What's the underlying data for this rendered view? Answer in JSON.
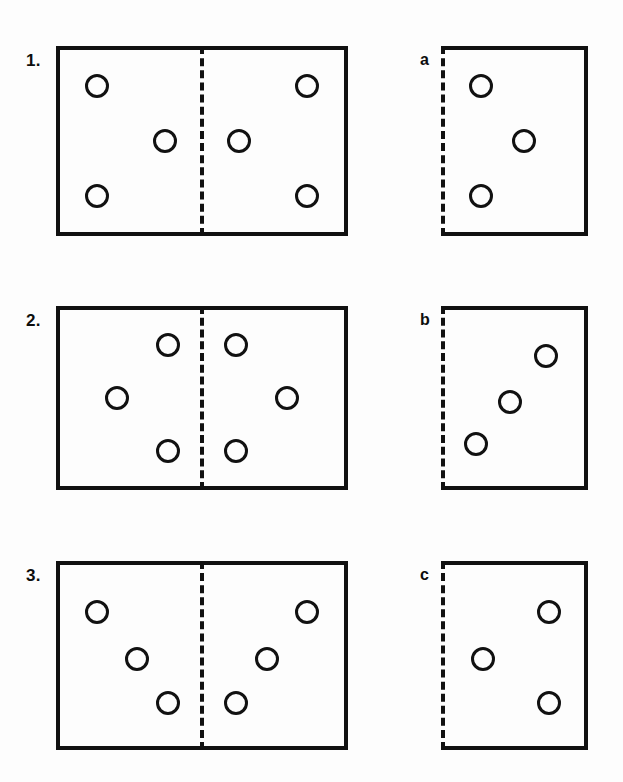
{
  "page": {
    "background_color": "#fdfdfd",
    "ink_color": "#111111",
    "width": 623,
    "height": 782
  },
  "legend": {
    "mirror_line_style": "dashed",
    "circle_style": "outline",
    "panel_border_style": "solid"
  },
  "rows": [
    {
      "id": "row-1",
      "top": 46,
      "height": 190,
      "question": {
        "label": "1.",
        "name": "question-panel-1",
        "mirror": "vertical-center-dashed",
        "dots": [
          {
            "name": "dot-1-left-top",
            "cx_pct": 13,
            "cy_pct": 20,
            "d": 24
          },
          {
            "name": "dot-1-left-middle",
            "cx_pct": 37,
            "cy_pct": 50,
            "d": 24
          },
          {
            "name": "dot-1-left-bottom",
            "cx_pct": 13,
            "cy_pct": 80,
            "d": 24
          },
          {
            "name": "dot-1-right-top",
            "cx_pct": 87,
            "cy_pct": 20,
            "d": 24
          },
          {
            "name": "dot-1-right-middle",
            "cx_pct": 63,
            "cy_pct": 50,
            "d": 24
          },
          {
            "name": "dot-1-right-bottom",
            "cx_pct": 87,
            "cy_pct": 80,
            "d": 24
          }
        ]
      },
      "answer": {
        "label": "a",
        "name": "answer-panel-a",
        "mirror": "left-edge-dashed",
        "dots": [
          {
            "name": "dot-a-top",
            "cx_pct": 26,
            "cy_pct": 20,
            "d": 24
          },
          {
            "name": "dot-a-middle",
            "cx_pct": 57,
            "cy_pct": 50,
            "d": 24
          },
          {
            "name": "dot-a-bottom",
            "cx_pct": 26,
            "cy_pct": 80,
            "d": 24
          }
        ]
      }
    },
    {
      "id": "row-2",
      "top": 306,
      "height": 184,
      "question": {
        "label": "2.",
        "name": "question-panel-2",
        "mirror": "vertical-center-dashed",
        "dots": [
          {
            "name": "dot-2-left-top",
            "cx_pct": 38,
            "cy_pct": 20,
            "d": 24
          },
          {
            "name": "dot-2-left-middle",
            "cx_pct": 20,
            "cy_pct": 50,
            "d": 24
          },
          {
            "name": "dot-2-left-bottom",
            "cx_pct": 38,
            "cy_pct": 80,
            "d": 24
          },
          {
            "name": "dot-2-right-top",
            "cx_pct": 62,
            "cy_pct": 20,
            "d": 24
          },
          {
            "name": "dot-2-right-middle",
            "cx_pct": 80,
            "cy_pct": 50,
            "d": 24
          },
          {
            "name": "dot-2-right-bottom",
            "cx_pct": 62,
            "cy_pct": 80,
            "d": 24
          }
        ]
      },
      "answer": {
        "label": "b",
        "name": "answer-panel-b",
        "mirror": "left-edge-dashed",
        "dots": [
          {
            "name": "dot-b-top",
            "cx_pct": 73,
            "cy_pct": 26,
            "d": 24
          },
          {
            "name": "dot-b-middle",
            "cx_pct": 47,
            "cy_pct": 52,
            "d": 24
          },
          {
            "name": "dot-b-bottom",
            "cx_pct": 22,
            "cy_pct": 76,
            "d": 24
          }
        ]
      }
    },
    {
      "id": "row-3",
      "top": 561,
      "height": 189,
      "question": {
        "label": "3.",
        "name": "question-panel-3",
        "mirror": "vertical-center-dashed",
        "dots": [
          {
            "name": "dot-3-left-top",
            "cx_pct": 13,
            "cy_pct": 26,
            "d": 24
          },
          {
            "name": "dot-3-left-middle",
            "cx_pct": 27,
            "cy_pct": 52,
            "d": 24
          },
          {
            "name": "dot-3-left-bottom",
            "cx_pct": 38,
            "cy_pct": 76,
            "d": 24
          },
          {
            "name": "dot-3-right-top",
            "cx_pct": 87,
            "cy_pct": 26,
            "d": 24
          },
          {
            "name": "dot-3-right-middle",
            "cx_pct": 73,
            "cy_pct": 52,
            "d": 24
          },
          {
            "name": "dot-3-right-bottom",
            "cx_pct": 62,
            "cy_pct": 76,
            "d": 24
          }
        ]
      },
      "answer": {
        "label": "c",
        "name": "answer-panel-c",
        "mirror": "left-edge-dashed",
        "dots": [
          {
            "name": "dot-c-top",
            "cx_pct": 75,
            "cy_pct": 26,
            "d": 24
          },
          {
            "name": "dot-c-middle",
            "cx_pct": 27,
            "cy_pct": 52,
            "d": 24
          },
          {
            "name": "dot-c-bottom",
            "cx_pct": 75,
            "cy_pct": 76,
            "d": 24
          }
        ]
      }
    }
  ]
}
